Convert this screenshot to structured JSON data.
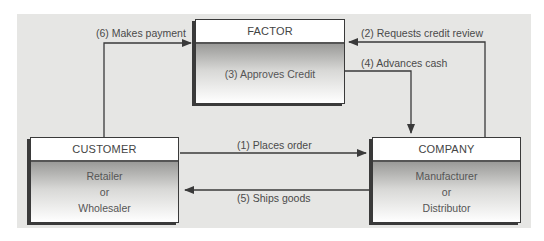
{
  "diagram": {
    "nodes": {
      "factor": {
        "title": "FACTOR",
        "body": [
          "(3) Approves Credit"
        ]
      },
      "customer": {
        "title": "CUSTOMER",
        "body": [
          "Retailer",
          "or",
          "Wholesaler"
        ]
      },
      "company": {
        "title": "COMPANY",
        "body": [
          "Manufacturer",
          "or",
          "Distributor"
        ]
      }
    },
    "edges": [
      {
        "step": 1,
        "label": "(1) Places order",
        "from": "customer",
        "to": "company"
      },
      {
        "step": 2,
        "label": "(2) Requests credit review",
        "from": "company",
        "to": "factor"
      },
      {
        "step": 4,
        "label": "(4) Advances cash",
        "from": "factor",
        "to": "company"
      },
      {
        "step": 5,
        "label": "(5) Ships goods",
        "from": "company",
        "to": "customer"
      },
      {
        "step": 6,
        "label": "(6) Makes payment",
        "from": "customer",
        "to": "factor"
      }
    ],
    "colors": {
      "panel": "#e6e6e4",
      "line": "#3a3a3a",
      "text": "#4a4a4a"
    }
  }
}
